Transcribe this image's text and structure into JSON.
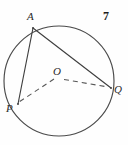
{
  "figure": {
    "number_label": "7",
    "caption": "",
    "background_color": "#fefefe",
    "stroke_color": "#4a4a4a",
    "text_color": "#2b2b2b"
  },
  "geometry": {
    "circle": {
      "name": "circle",
      "center_x": 59,
      "center_y": 81,
      "radius": 55
    },
    "points": [
      {
        "id": "A",
        "label": "A",
        "x": 33,
        "y": 28,
        "role": "point-on-circle"
      },
      {
        "id": "P",
        "label": "P",
        "x": 18,
        "y": 104,
        "role": "point-on-circle"
      },
      {
        "id": "Q",
        "label": "Q",
        "x": 111,
        "y": 88,
        "role": "point-on-circle"
      },
      {
        "id": "O",
        "label": "O",
        "x": 59,
        "y": 81,
        "role": "center"
      }
    ],
    "segments": [
      {
        "id": "AP",
        "from": "A",
        "to": "P",
        "style": "solid",
        "x1": 33,
        "y1": 28,
        "x2": 18,
        "y2": 104
      },
      {
        "id": "AQ",
        "from": "A",
        "to": "Q",
        "style": "solid",
        "x1": 33,
        "y1": 28,
        "x2": 111,
        "y2": 88
      },
      {
        "id": "OP",
        "from": "O",
        "to": "P",
        "style": "dashed",
        "x1": 54,
        "y1": 79,
        "x2": 19,
        "y2": 102
      },
      {
        "id": "OQ",
        "from": "O",
        "to": "Q",
        "style": "dashed",
        "x1": 64,
        "y1": 79,
        "x2": 108,
        "y2": 87
      }
    ]
  }
}
